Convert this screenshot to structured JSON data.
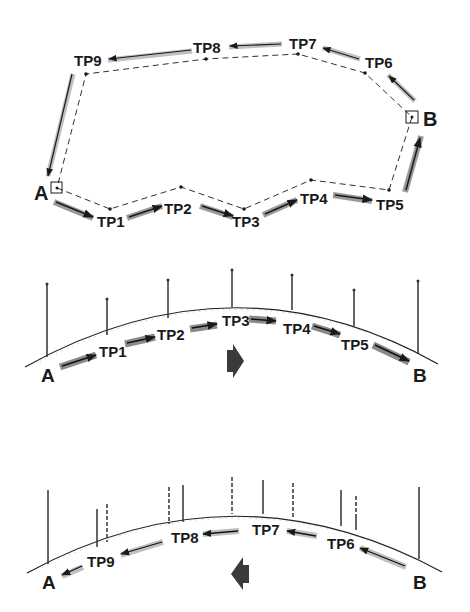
{
  "diagram": {
    "colors": {
      "ink": "#1a1a1a",
      "arrow_shadow": "#9a9a9a",
      "ground": "#222222",
      "direction_arrow": "#3a3a3a"
    },
    "plan_view": {
      "start": {
        "label": "A",
        "x": 57,
        "y": 188
      },
      "end": {
        "label": "B",
        "x": 412,
        "y": 117
      },
      "forward_points": [
        {
          "label": "TP1",
          "x": 110,
          "y": 209
        },
        {
          "label": "TP2",
          "x": 181,
          "y": 187
        },
        {
          "label": "TP3",
          "x": 244,
          "y": 209
        },
        {
          "label": "TP4",
          "x": 311,
          "y": 180
        },
        {
          "label": "TP5",
          "x": 389,
          "y": 190
        }
      ],
      "return_points": [
        {
          "label": "TP6",
          "x": 365,
          "y": 73
        },
        {
          "label": "TP7",
          "x": 298,
          "y": 54
        },
        {
          "label": "TP8",
          "x": 206,
          "y": 59
        },
        {
          "label": "TP9",
          "x": 86,
          "y": 74
        }
      ]
    },
    "profile_forward": {
      "start_label": "A",
      "end_label": "B",
      "points": [
        "TP1",
        "TP2",
        "TP3",
        "TP4",
        "TP5"
      ],
      "direction": "right-arrow"
    },
    "profile_return": {
      "start_label": "A",
      "end_label": "B",
      "points": [
        "TP6",
        "TP7",
        "TP8",
        "TP9"
      ],
      "direction": "left-arrow"
    }
  }
}
